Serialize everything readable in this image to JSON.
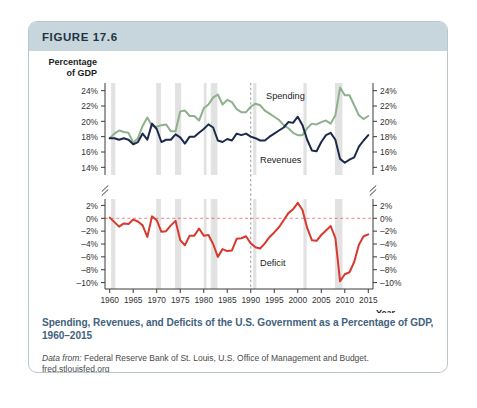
{
  "figure": {
    "number_label": "FIGURE 17.6",
    "caption": "Spending, Revenues, and Deficits of the U.S. Government  as a Percentage of GDP, 1960–2015",
    "source_lead": "Data from:",
    "source_text": " Federal Reserve Bank of St. Louis, U.S. Office of Management and Budget.",
    "source_url": "fred.stlouisfed.org"
  },
  "colors": {
    "header_band": "#c7d6dc",
    "card_border": "#b9c6cd",
    "spending_line": "#8fb08c",
    "revenues_line": "#1b2a4a",
    "deficit_line": "#d8392f",
    "recession_band": "#e2e2e2",
    "axis": "#3a3a3a",
    "caption": "#3f627d",
    "zero_line": "#9aa7b8"
  },
  "chart_data": {
    "type": "line",
    "title": "Spending, Revenues, and Deficits of the U.S. Government  as a Percentage of GDP, 1960–2015",
    "xlabel": "Year",
    "ylabel": "Percentage of GDP",
    "xlim": [
      1959,
      2016
    ],
    "xticks": [
      1960,
      1965,
      1970,
      1975,
      1980,
      1985,
      1990,
      1995,
      2000,
      2005,
      2010,
      2015
    ],
    "xticklabels": [
      "1960",
      "1965",
      "1970",
      "1975",
      "1980",
      "1985",
      "1990",
      "1995",
      "2000",
      "2005",
      "2010",
      "2015"
    ],
    "grid": false,
    "axis_break": true,
    "legend_position": "inline-annotations",
    "panels": [
      {
        "name": "upper",
        "ylim": [
          13,
          25
        ],
        "yticks": [
          14,
          16,
          18,
          20,
          22,
          24
        ],
        "yticklabels": [
          "14%",
          "16%",
          "18%",
          "20%",
          "22%",
          "24%"
        ],
        "dual_axis": true,
        "series": [
          {
            "name": "Spending",
            "color": "#8fb08c",
            "annotation": "Spending",
            "x": [
              1960,
              1961,
              1962,
              1963,
              1964,
              1965,
              1966,
              1967,
              1968,
              1969,
              1970,
              1971,
              1972,
              1973,
              1974,
              1975,
              1976,
              1977,
              1978,
              1979,
              1980,
              1981,
              1982,
              1983,
              1984,
              1985,
              1986,
              1987,
              1988,
              1989,
              1990,
              1991,
              1992,
              1993,
              1994,
              1995,
              1996,
              1997,
              1998,
              1999,
              2000,
              2001,
              2002,
              2003,
              2004,
              2005,
              2006,
              2007,
              2008,
              2009,
              2010,
              2011,
              2012,
              2013,
              2014,
              2015
            ],
            "values": [
              17.8,
              18.4,
              18.8,
              18.6,
              18.5,
              17.2,
              17.8,
              19.4,
              20.5,
              19.4,
              19.3,
              19.5,
              19.6,
              18.7,
              18.7,
              21.3,
              21.4,
              20.7,
              20.7,
              20.1,
              21.7,
              22.2,
              23.1,
              23.5,
              22.2,
              22.8,
              22.5,
              21.6,
              21.2,
              21.2,
              21.9,
              22.3,
              22.1,
              21.4,
              21.0,
              20.6,
              20.2,
              19.5,
              19.1,
              18.5,
              18.2,
              18.2,
              19.1,
              19.7,
              19.6,
              19.9,
              20.1,
              19.7,
              20.8,
              24.4,
              23.4,
              23.4,
              22.1,
              20.8,
              20.3,
              20.7
            ],
            "units": "% of GDP"
          },
          {
            "name": "Revenues",
            "color": "#1b2a4a",
            "annotation": "Revenues",
            "x": [
              1960,
              1961,
              1962,
              1963,
              1964,
              1965,
              1966,
              1967,
              1968,
              1969,
              1970,
              1971,
              1972,
              1973,
              1974,
              1975,
              1976,
              1977,
              1978,
              1979,
              1980,
              1981,
              1982,
              1983,
              1984,
              1985,
              1986,
              1987,
              1988,
              1989,
              1990,
              1991,
              1992,
              1993,
              1994,
              1995,
              1996,
              1997,
              1998,
              1999,
              2000,
              2001,
              2002,
              2003,
              2004,
              2005,
              2006,
              2007,
              2008,
              2009,
              2010,
              2011,
              2012,
              2013,
              2014,
              2015
            ],
            "values": [
              17.8,
              17.8,
              17.6,
              17.8,
              17.6,
              17.0,
              17.3,
              18.4,
              17.6,
              19.7,
              19.0,
              17.3,
              17.6,
              17.6,
              18.3,
              17.9,
              17.1,
              18.0,
              18.0,
              18.5,
              19.0,
              19.6,
              19.2,
              17.5,
              17.3,
              17.7,
              17.5,
              18.4,
              18.2,
              18.4,
              18.0,
              17.8,
              17.5,
              17.5,
              18.0,
              18.4,
              18.8,
              19.2,
              19.9,
              19.8,
              20.6,
              19.5,
              17.6,
              16.2,
              16.1,
              17.3,
              18.2,
              18.5,
              17.6,
              15.1,
              14.6,
              15.0,
              15.3,
              16.7,
              17.5,
              18.2
            ],
            "units": "% of GDP"
          }
        ]
      },
      {
        "name": "lower",
        "ylim": [
          -11,
          3
        ],
        "yticks": [
          2,
          0,
          -2,
          -4,
          -6,
          -8,
          -10
        ],
        "yticklabels": [
          "2%",
          "0%",
          "–2%",
          "–4%",
          "–6%",
          "–8%",
          "–10%"
        ],
        "dual_axis": true,
        "zero_reference_line": true,
        "series": [
          {
            "name": "Deficit",
            "color": "#d8392f",
            "annotation": "Deficit",
            "x": [
              1960,
              1961,
              1962,
              1963,
              1964,
              1965,
              1966,
              1967,
              1968,
              1969,
              1970,
              1971,
              1972,
              1973,
              1974,
              1975,
              1976,
              1977,
              1978,
              1979,
              1980,
              1981,
              1982,
              1983,
              1984,
              1985,
              1986,
              1987,
              1988,
              1989,
              1990,
              1991,
              1992,
              1993,
              1994,
              1995,
              1996,
              1997,
              1998,
              1999,
              2000,
              2001,
              2002,
              2003,
              2004,
              2005,
              2006,
              2007,
              2008,
              2009,
              2010,
              2011,
              2012,
              2013,
              2014,
              2015
            ],
            "values": [
              0.1,
              -0.6,
              -1.3,
              -0.8,
              -0.9,
              -0.2,
              -0.5,
              -1.1,
              -2.9,
              0.3,
              -0.3,
              -2.1,
              -2.0,
              -1.1,
              -0.4,
              -3.4,
              -4.2,
              -2.7,
              -2.7,
              -1.6,
              -2.7,
              -2.6,
              -4.0,
              -6.0,
              -4.8,
              -5.1,
              -5.0,
              -3.2,
              -3.1,
              -2.8,
              -3.9,
              -4.5,
              -4.7,
              -3.9,
              -2.9,
              -2.2,
              -1.4,
              -0.3,
              0.8,
              1.4,
              2.4,
              1.3,
              -1.5,
              -3.4,
              -3.5,
              -2.6,
              -1.9,
              -1.2,
              -3.1,
              -9.8,
              -8.7,
              -8.4,
              -6.8,
              -4.1,
              -2.8,
              -2.5
            ],
            "units": "% of GDP"
          }
        ]
      }
    ],
    "recession_bands": [
      {
        "start": 1960.3,
        "end": 1961.2
      },
      {
        "start": 1969.9,
        "end": 1970.9
      },
      {
        "start": 1973.9,
        "end": 1975.2
      },
      {
        "start": 1980.0,
        "end": 1980.6
      },
      {
        "start": 1981.5,
        "end": 1982.9
      },
      {
        "start": 1990.5,
        "end": 1991.2
      },
      {
        "start": 2001.2,
        "end": 2001.9
      },
      {
        "start": 2007.9,
        "end": 2009.5
      }
    ],
    "marker_lines": [
      {
        "x": 1990,
        "style": "dashed",
        "color": "#8a8a8a"
      }
    ]
  }
}
